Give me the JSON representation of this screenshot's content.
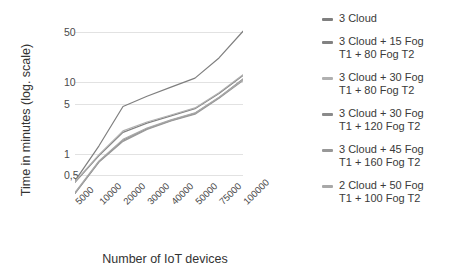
{
  "chart_data": {
    "type": "line",
    "title": "",
    "xlabel": "Number of IoT devices",
    "ylabel": "Time in minutes (log. scale)",
    "yscale": "log",
    "ylim": [
      0.25,
      70
    ],
    "grid": true,
    "legend_position": "right",
    "categories": [
      "5000",
      "10000",
      "20000",
      "30000",
      "40000",
      "50000",
      "75000",
      "100000"
    ],
    "yticks": [
      "50",
      "10",
      "5",
      "1",
      "0,5"
    ],
    "ytick_values": [
      50,
      10,
      5,
      1,
      0.5
    ],
    "series": [
      {
        "name": "3 Cloud",
        "color": "#7f7f7f",
        "values": [
          0.42,
          1.3,
          4.6,
          6.4,
          8.6,
          11.5,
          22.0,
          52.0
        ]
      },
      {
        "name": "3 Cloud  + 15 Fog\nT1 + 80 Fog T2",
        "color": "#828282",
        "values": [
          0.4,
          0.95,
          2.0,
          2.7,
          3.4,
          4.3,
          7.0,
          12.5
        ]
      },
      {
        "name": "3 Cloud + 30 Fog\nT1 + 80 Fog T2",
        "color": "#b0b0b0",
        "values": [
          0.41,
          0.98,
          2.1,
          2.8,
          3.5,
          4.4,
          7.2,
          12.8
        ]
      },
      {
        "name": "3 Cloud + 30 Fog\nT1 + 120 Fog T2",
        "color": "#8a8a8a",
        "values": [
          0.28,
          0.78,
          1.55,
          2.25,
          2.95,
          3.7,
          6.1,
          11.2
        ]
      },
      {
        "name": "3 Cloud + 45 Fog\nT1 + 160 Fog T2",
        "color": "#989898",
        "values": [
          0.28,
          0.77,
          1.5,
          2.2,
          2.9,
          3.6,
          6.0,
          10.6
        ]
      },
      {
        "name": "2 Cloud + 50 Fog\nT1 + 100 Fog T2",
        "color": "#a8a8a8",
        "values": [
          0.29,
          0.8,
          1.6,
          2.3,
          3.0,
          3.75,
          6.2,
          11.0
        ]
      }
    ]
  }
}
